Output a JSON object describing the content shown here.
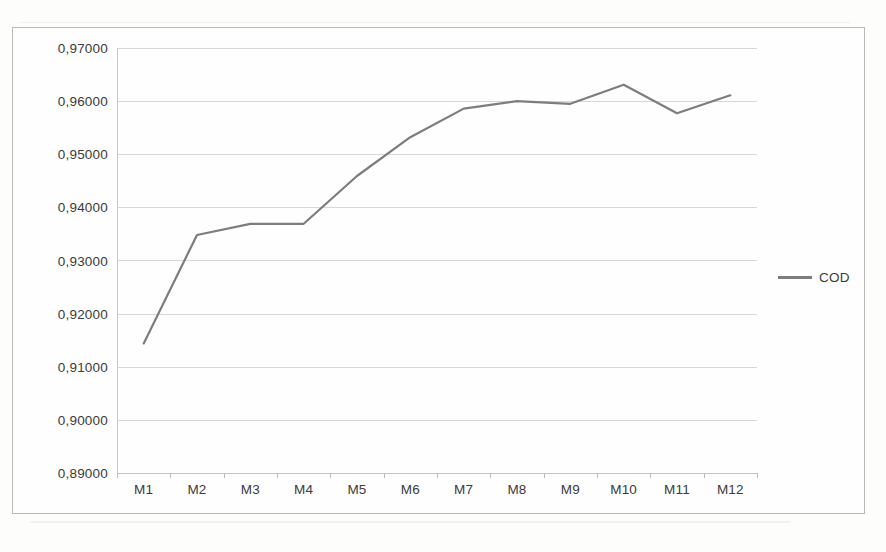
{
  "chart_data": {
    "type": "line",
    "title": "",
    "xlabel": "",
    "ylabel": "",
    "categories": [
      "M1",
      "M2",
      "M3",
      "M4",
      "M5",
      "M6",
      "M7",
      "M8",
      "M9",
      "M10",
      "M11",
      "M12"
    ],
    "series": [
      {
        "name": "COD",
        "color": "#7d7d7d",
        "values": [
          0.9144,
          0.9348,
          0.9369,
          0.9369,
          0.9459,
          0.9532,
          0.9586,
          0.96,
          0.9595,
          0.9631,
          0.9577,
          0.9611
        ]
      }
    ],
    "ylim": [
      0.89,
      0.97
    ],
    "ytick_values": [
      0.97,
      0.96,
      0.95,
      0.94,
      0.93,
      0.92,
      0.91,
      0.9,
      0.89
    ],
    "ytick_labels": [
      "0,97000",
      "0,96000",
      "0,95000",
      "0,94000",
      "0,93000",
      "0,92000",
      "0,91000",
      "0,90000",
      "0,89000"
    ],
    "ytick_step": 0.01,
    "grid": true,
    "grid_axis": "y",
    "legend_position": "right",
    "decimal_separator": ",",
    "xtick_labels": [
      "M1",
      "M2",
      "M3",
      "M4",
      "M5",
      "M6",
      "M7",
      "M8",
      "M9",
      "M10",
      "M11",
      "M12"
    ]
  },
  "legend": {
    "entries": [
      {
        "label": "COD",
        "color": "#7d7d7d"
      }
    ]
  },
  "colors": {
    "series_line": "#7d7d7d",
    "gridline": "#d7d7d4",
    "axis": "#c9c9c6",
    "text": "#3b3b3b",
    "frame": "#b9b9b6",
    "plot_background": "#fefefe",
    "page_background": "#fdfdfc"
  }
}
